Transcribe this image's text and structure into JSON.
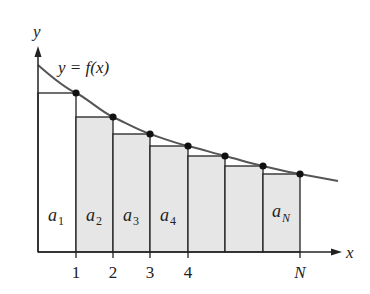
{
  "diagram": {
    "type": "riemann-sum-left-rectangles",
    "curve_label": "y = f(x)",
    "axis_labels": {
      "x": "x",
      "y": "y"
    },
    "x_ticks": [
      "1",
      "2",
      "3",
      "4",
      "N"
    ],
    "rect_labels": [
      {
        "base": "a",
        "sub": "1"
      },
      {
        "base": "a",
        "sub": "2"
      },
      {
        "base": "a",
        "sub": "3"
      },
      {
        "base": "a",
        "sub": "4"
      },
      {
        "base": "a",
        "sub": "N"
      }
    ],
    "colors": {
      "axis": "#222222",
      "curve": "#555555",
      "rect_fill_shaded": "#e6e6e6",
      "rect_fill_first": "#ffffff",
      "dot": "#111111"
    }
  }
}
